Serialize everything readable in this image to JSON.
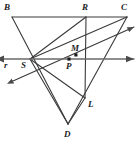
{
  "figure": {
    "type": "geometry-diagram",
    "width": 139,
    "height": 144,
    "background_color": "#ffffff",
    "stroke_color": "#3a3a3a",
    "line_color_r": "#555555",
    "label_color": "#1c1c1c"
  },
  "points": [
    {
      "id": "B",
      "label": "B",
      "x": 12,
      "y": 17,
      "label_x": 4,
      "label_y": 3,
      "marked": false
    },
    {
      "id": "R",
      "label": "R",
      "x": 86,
      "y": 17,
      "label_x": 82,
      "label_y": 3,
      "marked": false
    },
    {
      "id": "C",
      "label": "C",
      "x": 127,
      "y": 17,
      "label_x": 121,
      "label_y": 3,
      "marked": false
    },
    {
      "id": "S",
      "label": "S",
      "x": 30,
      "y": 59,
      "label_x": 21,
      "label_y": 61,
      "marked": false
    },
    {
      "id": "M",
      "label": "M",
      "x": 76,
      "y": 55,
      "label_x": 71,
      "label_y": 44,
      "marked": true
    },
    {
      "id": "P",
      "label": "P",
      "x": 69,
      "y": 59,
      "label_x": 66,
      "label_y": 62,
      "marked": true
    },
    {
      "id": "L",
      "label": "L",
      "x": 85,
      "y": 98,
      "label_x": 88,
      "label_y": 100,
      "marked": false
    },
    {
      "id": "D",
      "label": "D",
      "x": 68,
      "y": 124,
      "label_x": 64,
      "label_y": 130,
      "marked": false
    }
  ],
  "line_labels": [
    {
      "id": "r",
      "label": "r",
      "x": 4,
      "y": 61
    }
  ],
  "segments": [
    {
      "id": "BC",
      "from": "B",
      "to": "C",
      "x1": 12,
      "y1": 17,
      "x2": 127,
      "y2": 17
    },
    {
      "id": "BD",
      "from": "B",
      "to": "D",
      "x1": 12,
      "y1": 17,
      "x2": 68,
      "y2": 124
    },
    {
      "id": "RL",
      "from": "R",
      "to": "L",
      "x1": 86,
      "y1": 17,
      "x2": 85,
      "y2": 98
    },
    {
      "id": "RS",
      "from": "R",
      "to": "S",
      "x1": 86,
      "y1": 17,
      "x2": 30,
      "y2": 59
    },
    {
      "id": "CS",
      "from": "C",
      "to": "S",
      "x1": 127,
      "y1": 17,
      "x2": 30,
      "y2": 59
    },
    {
      "id": "SD",
      "from": "S",
      "to": "D",
      "x1": 30,
      "y1": 59,
      "x2": 68,
      "y2": 124
    },
    {
      "id": "SL",
      "from": "S",
      "to": "L",
      "x1": 30,
      "y1": 59,
      "x2": 85,
      "y2": 98
    },
    {
      "id": "DL",
      "from": "D",
      "to": "L",
      "x1": 68,
      "y1": 124,
      "x2": 85,
      "y2": 98
    },
    {
      "id": "CL_ext",
      "from": "C",
      "to": "D",
      "x1": 127,
      "y1": 17,
      "x2": 68,
      "y2": 124
    }
  ],
  "rays": [
    {
      "id": "line-r",
      "label": "r",
      "description": "horizontal double-headed line through S, P",
      "x1": 4,
      "y1": 59,
      "x2": 134,
      "y2": 59,
      "arrow_start": true,
      "arrow_end": true
    },
    {
      "id": "ray-through-M",
      "description": "oblique double-headed ray through S and M toward upper right",
      "x1": 13,
      "y1": 81,
      "x2": 134,
      "y2": 27,
      "arrow_start": true,
      "arrow_end": true
    }
  ]
}
